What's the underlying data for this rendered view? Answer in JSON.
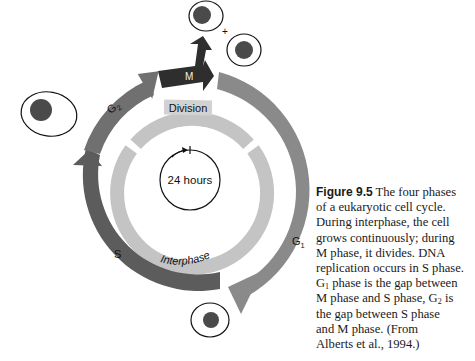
{
  "figure": {
    "number_label": "Figure 9.5",
    "caption_lines": [
      "The four phases",
      "of a eukaryotic cell cycle.",
      "During interphase, the cell",
      "grows continuously; during",
      "M phase, it divides. DNA",
      "replication occurs in S phase.",
      "phase is the gap between",
      "M phase and S phase, G",
      "is",
      "the gap between S phase",
      "and M phase. (From",
      "Alberts et al., 1994.)"
    ],
    "g1_sub_prefix": "G",
    "g1_sub": "1",
    "g2_sub": "2"
  },
  "diagram": {
    "center_label": "24 hours",
    "inner_ring_labels": {
      "top": "Division",
      "bottom": "Interphase"
    },
    "phases": [
      {
        "id": "M",
        "label": "M",
        "color": "#2e2e2e"
      },
      {
        "id": "G1",
        "label": "G",
        "sub": "1",
        "color": "#8a8a8a"
      },
      {
        "id": "S",
        "label": "S",
        "color": "#5a5a5a"
      },
      {
        "id": "G2",
        "label": "G",
        "sub": "2",
        "color": "#6e6e6e"
      }
    ],
    "plus_sign": "+",
    "colors": {
      "inner_ring": "#c4c4c4",
      "label_box": "#cfcfcf",
      "nucleus": "#4a4a4a",
      "outline": "#111111"
    }
  }
}
